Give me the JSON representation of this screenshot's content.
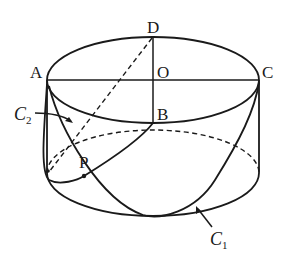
{
  "diagram": {
    "colors": {
      "stroke": "#1a1a1a",
      "background": "#ffffff"
    },
    "points": {
      "A": "A",
      "B": "B",
      "C": "C",
      "D": "D",
      "O": "O",
      "P": "P"
    },
    "curves": {
      "c1_letter": "C",
      "c1_sub": "1",
      "c2_letter": "C",
      "c2_sub": "2"
    }
  }
}
